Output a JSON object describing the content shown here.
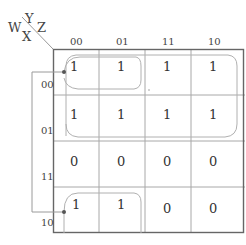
{
  "kmap": {
    "row_var_label": "WX",
    "col_var_label": "YZ",
    "row_vars": {
      "w": "W",
      "x": "X"
    },
    "col_vars": {
      "y": "Y",
      "z": "Z"
    },
    "col_headers": [
      "00",
      "01",
      "11",
      "10"
    ],
    "row_headers": [
      "00",
      "01",
      "11",
      "10"
    ],
    "cells": [
      [
        "1",
        "1",
        "1",
        "1"
      ],
      [
        "1",
        "1",
        "1",
        "1"
      ],
      [
        "0",
        "0",
        "0",
        "0"
      ],
      [
        "1",
        "1",
        "0",
        "0"
      ]
    ],
    "groups": [
      {
        "name": "rows-00-01-all-columns",
        "rows": [
          "00",
          "01"
        ],
        "cols": [
          "00",
          "01",
          "11",
          "10"
        ]
      },
      {
        "name": "wraparound-rows-00-10-cols-00-01",
        "rows": [
          "00",
          "10"
        ],
        "cols": [
          "00",
          "01"
        ]
      }
    ]
  },
  "colors": {
    "grid_outer": "#666666",
    "grid_inner": "#a8a8a8",
    "loop": "#b0b0b0",
    "bracket": "#9a9a9a",
    "dot": "#555555",
    "text": "#333333"
  }
}
